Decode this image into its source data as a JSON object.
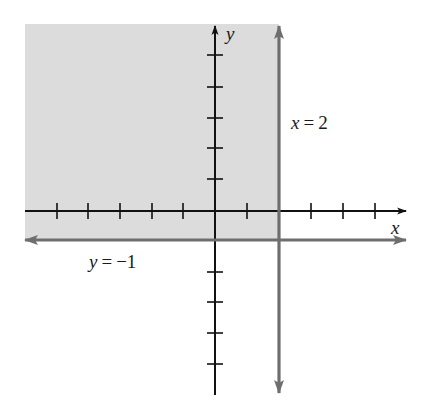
{
  "figure": {
    "colors": {
      "background": "#ffffff",
      "shading": "#dcdcdc",
      "axes": "#111111",
      "boundary_lines": "#6e6e6e",
      "text": "#1a1a1a"
    },
    "axes": {
      "x_label": "x",
      "y_label": "y",
      "x_ticks": [
        -5,
        -4,
        -3,
        -2,
        -1,
        1,
        2,
        3,
        4,
        5
      ],
      "y_ticks": [
        -5,
        -4,
        -3,
        -2,
        -1,
        1,
        2,
        3,
        4,
        5
      ],
      "unit_px": 31.6,
      "origin_px": [
        215,
        211
      ]
    },
    "boundary_lines": [
      {
        "id": "vertical",
        "equation_var": "x",
        "equals": "=",
        "value": "2",
        "label": "x = 2",
        "orientation": "vertical",
        "x": 2
      },
      {
        "id": "horizontal",
        "equation_var": "y",
        "equals": "=",
        "value": "−1",
        "label": "y = −1",
        "orientation": "horizontal",
        "y": -1
      }
    ],
    "shaded_region": {
      "description": "x <= 2 and y >= -1",
      "x_max": 2,
      "y_min": -1
    }
  }
}
